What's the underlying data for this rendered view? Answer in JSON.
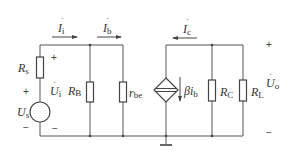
{
  "diagram": {
    "type": "small-signal equivalent circuit",
    "colors": {
      "line": "#555555",
      "text": "#333333",
      "background": "#ffffff"
    },
    "components": [
      {
        "id": "Rs",
        "kind": "resistor",
        "symbol": "R",
        "subscript": "s"
      },
      {
        "id": "Us",
        "kind": "voltage-source",
        "symbol": "U",
        "subscript": "s",
        "dot": true
      },
      {
        "id": "RB",
        "kind": "resistor",
        "symbol": "R",
        "subscript": "B"
      },
      {
        "id": "rbe",
        "kind": "resistor",
        "symbol": "r",
        "subscript": "be"
      },
      {
        "id": "dep",
        "kind": "dependent-current-source",
        "symbol": "βi",
        "subscript": "b"
      },
      {
        "id": "RC",
        "kind": "resistor",
        "symbol": "R",
        "subscript": "C"
      },
      {
        "id": "RL",
        "kind": "resistor",
        "symbol": "R",
        "subscript": "L"
      }
    ],
    "currents": [
      {
        "id": "Ii",
        "symbol": "I",
        "subscript": "i",
        "direction": "right"
      },
      {
        "id": "Ib",
        "symbol": "I",
        "subscript": "b",
        "direction": "right"
      },
      {
        "id": "Ic",
        "symbol": "I",
        "subscript": "c",
        "direction": "left"
      }
    ],
    "voltages": [
      {
        "id": "Ui",
        "symbol": "U",
        "subscript": "i",
        "plus": "+",
        "minus": "−"
      },
      {
        "id": "Uo",
        "symbol": "U",
        "subscript": "o",
        "plus": "+",
        "minus": "−"
      }
    ],
    "labels": {
      "Rs": "R",
      "Rs_sub": "s",
      "Us": "U",
      "Us_sub": "s",
      "Us_plus": "+",
      "Us_minus": "−",
      "Ui": "U",
      "Ui_sub": "i",
      "Ui_plus": "+",
      "Ui_minus": "−",
      "RB": "R",
      "RB_sub": "B",
      "rbe": "r",
      "rbe_sub": "be",
      "Ii": "I",
      "Ii_sub": "i",
      "Ib": "I",
      "Ib_sub": "b",
      "Ic": "I",
      "Ic_sub": "c",
      "dep": "βi",
      "dep_sub": "b",
      "RC": "R",
      "RC_sub": "C",
      "RL": "R",
      "RL_sub": "L",
      "Uo": "U",
      "Uo_sub": "o",
      "Uo_plus": "+",
      "Uo_minus": "−"
    }
  }
}
